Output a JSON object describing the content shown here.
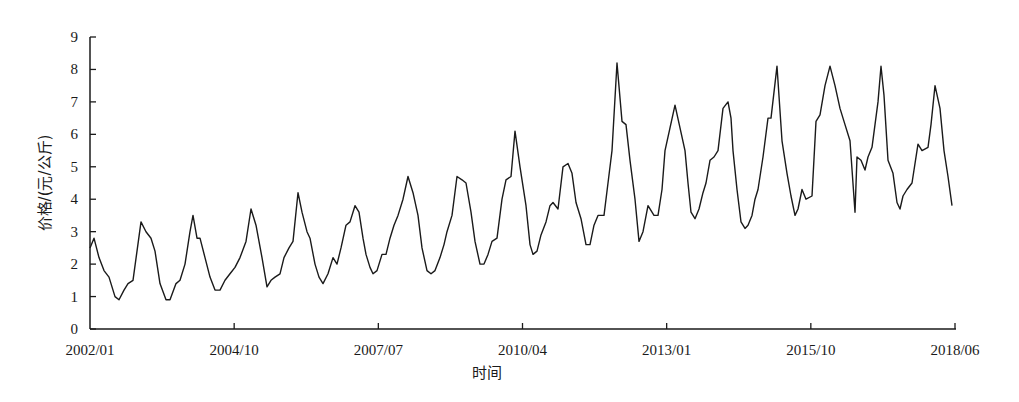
{
  "chart_data": {
    "type": "line",
    "title": "",
    "xlabel": "时间",
    "ylabel": "价格/(元/公斤)",
    "ylim": [
      0,
      9
    ],
    "yticks": [
      0,
      1,
      2,
      3,
      4,
      5,
      6,
      7,
      8,
      9
    ],
    "xticks": [
      "2002/01",
      "2004/10",
      "2007/07",
      "2010/04",
      "2013/01",
      "2015/10",
      "2018/06"
    ],
    "grid": false,
    "legend": null,
    "series": [
      {
        "name": "价格",
        "color": "#1a1a1a",
        "points_px_x": [
          90,
          94,
          99,
          104,
          109,
          115,
          119,
          124,
          128,
          133,
          137,
          141,
          146,
          151,
          155,
          160,
          166,
          170,
          176,
          180,
          185,
          190,
          193,
          197,
          200,
          205,
          210,
          215,
          220,
          225,
          230,
          235,
          240,
          246,
          251,
          256,
          262,
          267,
          271,
          275,
          280,
          284,
          289,
          293,
          298,
          302,
          307,
          310,
          315,
          319,
          323,
          328,
          333,
          337,
          341,
          346,
          350,
          355,
          359,
          363,
          366,
          370,
          373,
          377,
          382,
          386,
          390,
          394,
          398,
          403,
          408,
          413,
          418,
          422,
          427,
          431,
          435,
          440,
          444,
          447,
          452,
          457,
          462,
          466,
          471,
          475,
          480,
          484,
          488,
          492,
          497,
          502,
          506,
          511,
          515,
          520,
          526,
          530,
          533,
          537,
          541,
          546,
          550,
          553,
          558,
          563,
          568,
          572,
          576,
          581,
          586,
          590,
          594,
          598,
          604,
          608,
          612,
          617,
          622,
          626,
          630,
          635,
          639,
          643,
          648,
          654,
          658,
          662,
          665,
          670,
          675,
          680,
          685,
          688,
          691,
          695,
          699,
          703,
          706,
          710,
          714,
          718,
          723,
          728,
          731,
          733,
          737,
          741,
          745,
          748,
          752,
          755,
          758,
          763,
          768,
          771,
          777,
          782,
          787,
          791,
          795,
          798,
          802,
          806,
          812,
          816,
          820,
          825,
          830,
          835,
          840,
          845,
          850,
          855,
          857,
          861,
          865,
          868,
          872,
          878,
          881,
          884,
          888,
          893,
          897,
          900,
          903,
          907,
          912,
          918,
          922,
          928,
          931,
          935,
          940,
          944,
          948,
          952,
          955
        ],
        "values": [
          2.5,
          2.8,
          2.2,
          1.8,
          1.6,
          1.0,
          0.9,
          1.2,
          1.4,
          1.5,
          2.4,
          3.3,
          3.0,
          2.8,
          2.4,
          1.4,
          0.9,
          0.9,
          1.4,
          1.5,
          2.0,
          3.0,
          3.5,
          2.8,
          2.8,
          2.2,
          1.6,
          1.2,
          1.2,
          1.5,
          1.7,
          1.9,
          2.2,
          2.7,
          3.7,
          3.2,
          2.2,
          1.3,
          1.5,
          1.6,
          1.7,
          2.2,
          2.5,
          2.7,
          4.2,
          3.6,
          3.0,
          2.8,
          2.0,
          1.6,
          1.4,
          1.7,
          2.2,
          2.0,
          2.5,
          3.2,
          3.3,
          3.8,
          3.6,
          2.8,
          2.3,
          1.9,
          1.7,
          1.8,
          2.3,
          2.3,
          2.8,
          3.2,
          3.5,
          4.0,
          4.7,
          4.2,
          3.5,
          2.5,
          1.8,
          1.7,
          1.8,
          2.2,
          2.6,
          3.0,
          3.5,
          4.7,
          4.6,
          4.5,
          3.6,
          2.7,
          2.0,
          2.0,
          2.3,
          2.7,
          2.8,
          4.0,
          4.6,
          4.7,
          6.1,
          5.0,
          3.8,
          2.6,
          2.3,
          2.4,
          2.9,
          3.3,
          3.8,
          3.9,
          3.7,
          5.0,
          5.1,
          4.8,
          3.9,
          3.4,
          2.6,
          2.6,
          3.2,
          3.5,
          3.5,
          4.5,
          5.5,
          8.2,
          6.4,
          6.3,
          5.2,
          4.0,
          2.7,
          3.0,
          3.8,
          3.5,
          3.5,
          4.3,
          5.5,
          6.2,
          6.9,
          6.2,
          5.5,
          4.5,
          3.6,
          3.4,
          3.7,
          4.2,
          4.5,
          5.2,
          5.3,
          5.5,
          6.8,
          7.0,
          6.5,
          5.5,
          4.3,
          3.3,
          3.1,
          3.2,
          3.5,
          4.0,
          4.3,
          5.3,
          6.5,
          6.5,
          8.1,
          5.8,
          4.8,
          4.1,
          3.5,
          3.7,
          4.3,
          4.0,
          4.1,
          6.4,
          6.6,
          7.5,
          8.1,
          7.5,
          6.8,
          6.3,
          5.8,
          3.6,
          5.3,
          5.2,
          4.9,
          5.3,
          5.6,
          7.0,
          8.1,
          7.2,
          5.2,
          4.8,
          3.9,
          3.7,
          4.1,
          4.3,
          4.5,
          5.7,
          5.5,
          5.6,
          6.3,
          7.5,
          6.8,
          5.5,
          4.7,
          3.8
        ]
      }
    ]
  },
  "axes": {
    "x_title": "时间",
    "y_title": "价格/(元/公斤)"
  }
}
